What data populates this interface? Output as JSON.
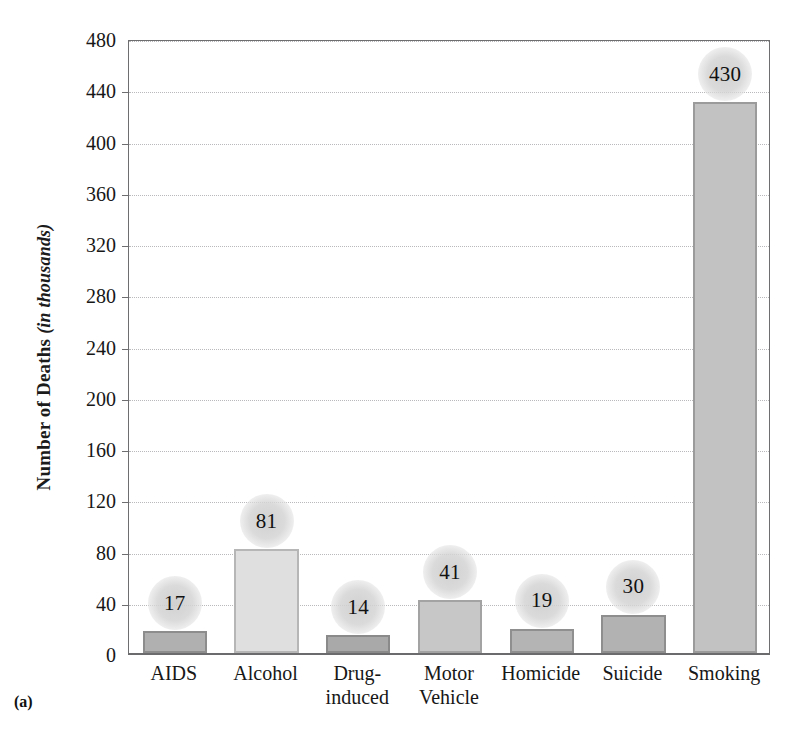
{
  "figure": {
    "caption": "(a)"
  },
  "chart_data": {
    "type": "bar",
    "title": "",
    "xlabel": "",
    "ylabel": "Number of Deaths (in thousands)",
    "ylabel_main": "Number of Deaths ",
    "ylabel_unit": "(in thousands)",
    "categories": [
      "AIDS",
      "Alcohol",
      "Drug-induced",
      "Motor Vehicle",
      "Homicide",
      "Suicide",
      "Smoking"
    ],
    "category_lines": [
      [
        "AIDS"
      ],
      [
        "Alcohol"
      ],
      [
        "Drug-",
        "induced"
      ],
      [
        "Motor",
        "Vehicle"
      ],
      [
        "Homicide"
      ],
      [
        "Suicide"
      ],
      [
        "Smoking"
      ]
    ],
    "values": [
      17,
      81,
      14,
      41,
      19,
      30,
      430
    ],
    "value_labels": [
      "17",
      "81",
      "14",
      "41",
      "19",
      "30",
      "430"
    ],
    "ylim": [
      0,
      480
    ],
    "yticks": [
      0,
      40,
      80,
      120,
      160,
      200,
      240,
      280,
      320,
      360,
      400,
      440,
      480
    ],
    "ytick_labels": [
      "0",
      "40",
      "80",
      "120",
      "160",
      "200",
      "240",
      "280",
      "320",
      "360",
      "400",
      "440",
      "480"
    ],
    "grid": true,
    "grid_style": "dotted",
    "legend": "none",
    "bar_fills": [
      "#b0b0b0",
      "#dfdfdf",
      "#a9a9a9",
      "#c7c7c7",
      "#b4b4b4",
      "#b2b2b2",
      "#c2c2c2"
    ],
    "bar_edges": [
      "#8d8d8d",
      "#b6b6b6",
      "#8a8a8a",
      "#a3a3a3",
      "#8f8f8f",
      "#8e8e8e",
      "#9b9b9b"
    ],
    "colors": {
      "axis": "#6e6e70",
      "gridline": "#b9b9bb",
      "text": "#171717",
      "badge": "#d2d2d2",
      "background": "#ffffff"
    }
  }
}
